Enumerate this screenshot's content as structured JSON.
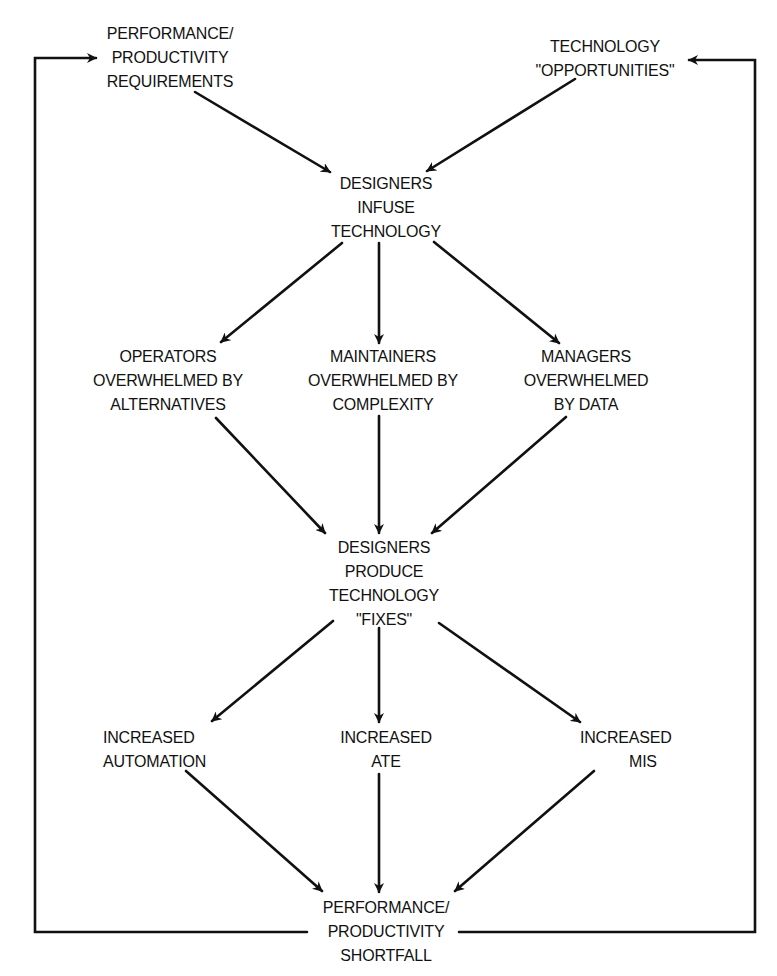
{
  "diagram": {
    "type": "flow-cycle",
    "nodes": {
      "requirements": {
        "lines": [
          "PERFORMANCE/",
          "PRODUCTIVITY",
          "REQUIREMENTS"
        ]
      },
      "opportunities": {
        "lines": [
          "TECHNOLOGY",
          "\"OPPORTUNITIES\""
        ]
      },
      "infuse": {
        "lines": [
          "DESIGNERS",
          "INFUSE",
          "TECHNOLOGY"
        ]
      },
      "operators": {
        "lines": [
          "OPERATORS",
          "OVERWHELMED BY",
          "ALTERNATIVES"
        ]
      },
      "maintainers": {
        "lines": [
          "MAINTAINERS",
          "OVERWHELMED BY",
          "COMPLEXITY"
        ]
      },
      "managers": {
        "lines": [
          "MANAGERS",
          "OVERWHELMED",
          "BY DATA"
        ]
      },
      "fixes": {
        "lines": [
          "DESIGNERS",
          "PRODUCE",
          "TECHNOLOGY",
          "\"FIXES\""
        ]
      },
      "automation": {
        "lines": [
          "INCREASED",
          "AUTOMATION"
        ]
      },
      "ate": {
        "lines": [
          "INCREASED",
          "ATE"
        ]
      },
      "mis": {
        "lines": [
          "INCREASED",
          "MIS"
        ]
      },
      "shortfall": {
        "lines": [
          "PERFORMANCE/",
          "PRODUCTIVITY",
          "SHORTFALL"
        ]
      }
    },
    "edges": [
      [
        "requirements",
        "infuse"
      ],
      [
        "opportunities",
        "infuse"
      ],
      [
        "infuse",
        "operators"
      ],
      [
        "infuse",
        "maintainers"
      ],
      [
        "infuse",
        "managers"
      ],
      [
        "operators",
        "fixes"
      ],
      [
        "maintainers",
        "fixes"
      ],
      [
        "managers",
        "fixes"
      ],
      [
        "fixes",
        "automation"
      ],
      [
        "fixes",
        "ate"
      ],
      [
        "fixes",
        "mis"
      ],
      [
        "automation",
        "shortfall"
      ],
      [
        "ate",
        "shortfall"
      ],
      [
        "mis",
        "shortfall"
      ],
      [
        "shortfall",
        "requirements"
      ],
      [
        "shortfall",
        "opportunities"
      ]
    ],
    "colors": {
      "ink": "#111111",
      "background": "#ffffff"
    }
  }
}
